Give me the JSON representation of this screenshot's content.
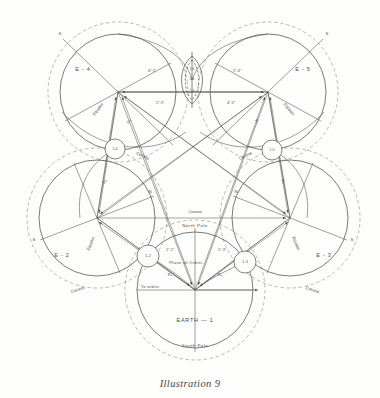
{
  "figure": {
    "caption": "Illustration 9",
    "bodies": [
      {
        "id": "earth-1",
        "label": "EARTH — 1",
        "cx": 195,
        "cy": 290,
        "r": 58,
        "corona_r": 70,
        "rot": 0
      },
      {
        "id": "e-2",
        "label": "E - 2",
        "cx": 97,
        "cy": 218,
        "r": 58,
        "corona_r": 70,
        "rot": -72
      },
      {
        "id": "e-3",
        "label": "E - 3",
        "cx": 290,
        "cy": 218,
        "r": 58,
        "corona_r": 70,
        "rot": 72
      },
      {
        "id": "e-4",
        "label": "E - 4",
        "cx": 118,
        "cy": 92,
        "r": 58,
        "corona_r": 70,
        "rot": -144
      },
      {
        "id": "e-5",
        "label": "E - 5",
        "cx": 268,
        "cy": 92,
        "r": 58,
        "corona_r": 70,
        "rot": 144
      }
    ],
    "moons": [
      {
        "id": "m-1-2",
        "label": "1-2",
        "cx": 148,
        "cy": 256,
        "r": 11
      },
      {
        "id": "m-1-3",
        "label": "1-3",
        "cx": 245,
        "cy": 262,
        "r": 11
      },
      {
        "id": "m-1-4",
        "label": "1-4",
        "cx": 115,
        "cy": 149,
        "r": 10
      },
      {
        "id": "m-1-5",
        "label": "1-5",
        "cx": 272,
        "cy": 150,
        "r": 10
      },
      {
        "id": "m-top",
        "label": "1-6",
        "cx": 192,
        "cy": 80,
        "r": 11
      }
    ],
    "labels": {
      "corona": "Corona",
      "equator": "Equator",
      "north_pole": "North Pole",
      "south_pole": "South Pole",
      "plane_of_orbits": "Plane of Orbits",
      "to_orbits": "To orbits",
      "axis_n": "N",
      "axis_s": "S"
    },
    "corona_labels": [
      {
        "id": "corona-earth-top",
        "text": "Corona",
        "x": 195,
        "y": 213
      },
      {
        "id": "corona-left",
        "text": "Corona",
        "x": 78,
        "y": 289
      },
      {
        "id": "corona-right",
        "text": "Corona",
        "x": 312,
        "y": 289
      },
      {
        "id": "corona-e4-lo",
        "text": "Corona",
        "x": 138,
        "y": 155
      },
      {
        "id": "corona-e5-lo",
        "text": "Corona",
        "x": 248,
        "y": 155
      }
    ],
    "dimensions": [
      {
        "id": "dim-e4-top",
        "text": "4\"-5\"",
        "x": 152,
        "y": 72
      },
      {
        "id": "dim-e5-top",
        "text": "5\"-4\"",
        "x": 237,
        "y": 72
      },
      {
        "id": "dim-e4-lo",
        "text": "5\"-3\"",
        "x": 160,
        "y": 104
      },
      {
        "id": "dim-e5-lo",
        "text": "4\"-2\"",
        "x": 231,
        "y": 104
      },
      {
        "id": "dim-lens-a",
        "text": "1-6",
        "x": 192,
        "y": 70
      },
      {
        "id": "dim-lens-b",
        "text": "1-6",
        "x": 192,
        "y": 79
      },
      {
        "id": "dim-lens-c",
        "text": "1-6",
        "x": 192,
        "y": 91
      },
      {
        "id": "dim-e1-left",
        "text": "2\"-1\"",
        "x": 170,
        "y": 253
      },
      {
        "id": "dim-e1-right",
        "text": "1\"-3\"",
        "x": 222,
        "y": 253
      },
      {
        "id": "dim-r-left",
        "text": "R₂",
        "x": 170,
        "y": 275
      },
      {
        "id": "dim-r-right",
        "text": "R₃",
        "x": 220,
        "y": 275
      },
      {
        "id": "dim-e2-r",
        "text": "R₄",
        "x": 103,
        "y": 180
      },
      {
        "id": "dim-e3-r",
        "text": "R₅",
        "x": 283,
        "y": 180
      },
      {
        "id": "dim-e4-r",
        "text": "R₆",
        "x": 130,
        "y": 122
      },
      {
        "id": "dim-e5-r",
        "text": "R₇",
        "x": 256,
        "y": 122
      }
    ],
    "style": {
      "ink": "#4f4f4d",
      "ink_light": "#8a8a87",
      "paper": "#fdfdfb"
    }
  }
}
